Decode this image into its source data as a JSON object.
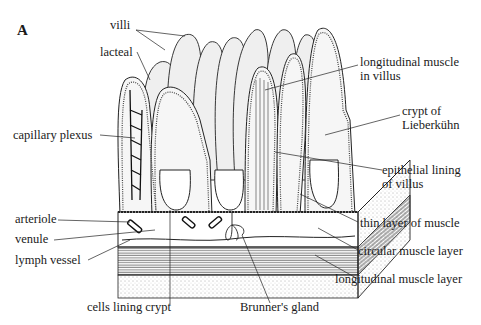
{
  "figure": {
    "panel_label": "A",
    "colors": {
      "ink": "#1a1a1a",
      "fill": "#eeeeee",
      "background": "#ffffff"
    }
  },
  "labels": {
    "villi": "villi",
    "lacteal": "lacteal",
    "capillary_plexus": "capillary plexus",
    "longitudinal_muscle_in_villus_1": "longitudinal muscle",
    "longitudinal_muscle_in_villus_2": "in villus",
    "crypt_1": "crypt of",
    "crypt_2": "Lieberkühn",
    "epithelial_1": "epithelial lining",
    "epithelial_2": "of villus",
    "arteriole": "arteriole",
    "venule": "venule",
    "lymph_vessel": "lymph vessel",
    "thin_muscle": "thin layer of muscle",
    "circular_muscle": "circular muscle layer",
    "longitudinal_muscle_layer": "longitudinal muscle layer",
    "cells_lining_crypt": "cells lining crypt",
    "brunners_gland": "Brunner's gland"
  }
}
